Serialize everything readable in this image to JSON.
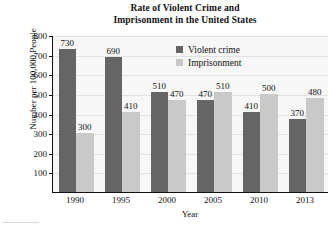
{
  "chart_data": {
    "type": "bar",
    "title": "Rate of Violent Crime and Imprisonment in the United States",
    "title_line1": "Rate of Violent Crime and",
    "title_line2": "Imprisonment in the United States",
    "xlabel": "Year",
    "ylabel": "Number per 100,000 People",
    "categories": [
      "1990",
      "1995",
      "2000",
      "2005",
      "2010",
      "2013"
    ],
    "series": [
      {
        "name": "Violent crime",
        "color": "#656565",
        "values": [
          730,
          690,
          510,
          470,
          410,
          370
        ]
      },
      {
        "name": "Imprisonment",
        "color": "#c9c9c9",
        "values": [
          300,
          410,
          470,
          510,
          500,
          480
        ]
      }
    ],
    "ylim": [
      0,
      800
    ],
    "yticks": [
      100,
      200,
      300,
      400,
      500,
      600,
      700,
      800
    ],
    "ytick_labels": [
      "100",
      "200",
      "300",
      "400",
      "500",
      "600",
      "700",
      "800"
    ],
    "grid": true,
    "grid_axis": "y",
    "legend_position": "upper right",
    "data_labels": true,
    "plot_background": "#f7f7f7"
  },
  "legend": {
    "items": [
      {
        "label": "Violent crime"
      },
      {
        "label": "Imprisonment"
      }
    ]
  }
}
